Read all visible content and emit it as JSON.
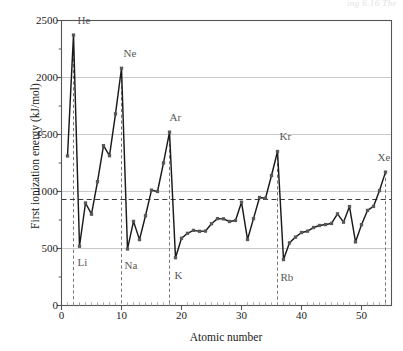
{
  "figure": {
    "caption_remnant": "ing 6.16  The",
    "colors": {
      "line": "#1a1a1a",
      "marker": "#585858",
      "gridline": "#c9c9c9",
      "axis": "#555555",
      "dashed_guide": "#3a3a3a",
      "dashed_drop": "#6e6e6e",
      "label_text": "#1a1a1a",
      "element_label": "#585858",
      "background": "#ffffff"
    }
  },
  "chart_data": {
    "type": "line",
    "title": "",
    "xlabel": "Atomic number",
    "ylabel": "First ionization energy (kJ/mol)",
    "xlim": [
      0,
      55
    ],
    "ylim": [
      0,
      2500
    ],
    "xticks": [
      0,
      10,
      20,
      30,
      40,
      50
    ],
    "yticks": [
      0,
      500,
      1000,
      1500,
      2000,
      2500
    ],
    "xminor_step": 1,
    "grid": "horizontal-major",
    "legend": "none",
    "guide_line": {
      "label": "",
      "value": 930,
      "style": "dashed",
      "orientation": "horizontal"
    },
    "noble_gas_drop_lines": [
      {
        "symbol": "He",
        "x": 2,
        "y": 2372
      },
      {
        "symbol": "Ne",
        "x": 10,
        "y": 2081
      },
      {
        "symbol": "Ar",
        "x": 18,
        "y": 1521
      },
      {
        "symbol": "Kr",
        "x": 36,
        "y": 1351
      },
      {
        "symbol": "Xe",
        "x": 54,
        "y": 1170
      }
    ],
    "annotations": [
      {
        "text": "He",
        "x": 2,
        "y": 2372,
        "dx": 4,
        "dy": -15
      },
      {
        "text": "Ne",
        "x": 10,
        "y": 2081,
        "dx": 2,
        "dy": -15
      },
      {
        "text": "Ar",
        "x": 18,
        "y": 1521,
        "dx": 0,
        "dy": -15
      },
      {
        "text": "Kr",
        "x": 36,
        "y": 1351,
        "dx": 2,
        "dy": -15
      },
      {
        "text": "Xe",
        "x": 54,
        "y": 1170,
        "dx": -8,
        "dy": -15
      },
      {
        "text": "Li",
        "x": 3,
        "y": 520,
        "dx": -2,
        "dy": 16
      },
      {
        "text": "Na",
        "x": 11,
        "y": 496,
        "dx": -3,
        "dy": 16
      },
      {
        "text": "K",
        "x": 19,
        "y": 419,
        "dx": -1,
        "dy": 17
      },
      {
        "text": "Rb",
        "x": 37,
        "y": 403,
        "dx": -3,
        "dy": 17
      }
    ],
    "x": [
      1,
      2,
      3,
      4,
      5,
      6,
      7,
      8,
      9,
      10,
      11,
      12,
      13,
      14,
      15,
      16,
      17,
      18,
      19,
      20,
      21,
      22,
      23,
      24,
      25,
      26,
      27,
      28,
      29,
      30,
      31,
      32,
      33,
      34,
      35,
      36,
      37,
      38,
      39,
      40,
      41,
      42,
      43,
      44,
      45,
      46,
      47,
      48,
      49,
      50,
      51,
      52,
      53,
      54
    ],
    "series": [
      {
        "name": "First ionization energy",
        "element_symbols": [
          "H",
          "He",
          "Li",
          "Be",
          "B",
          "C",
          "N",
          "O",
          "F",
          "Ne",
          "Na",
          "Mg",
          "Al",
          "Si",
          "P",
          "S",
          "Cl",
          "Ar",
          "K",
          "Ca",
          "Sc",
          "Ti",
          "V",
          "Cr",
          "Mn",
          "Fe",
          "Co",
          "Ni",
          "Cu",
          "Zn",
          "Ga",
          "Ge",
          "As",
          "Se",
          "Br",
          "Kr",
          "Rb",
          "Sr",
          "Y",
          "Zr",
          "Nb",
          "Mo",
          "Tc",
          "Ru",
          "Rh",
          "Pd",
          "Ag",
          "Cd",
          "In",
          "Sn",
          "Sb",
          "Te",
          "I",
          "Xe"
        ],
        "values": [
          1312,
          2372,
          520,
          899,
          801,
          1086,
          1402,
          1314,
          1681,
          2081,
          496,
          738,
          578,
          787,
          1012,
          1000,
          1251,
          1521,
          419,
          590,
          633,
          659,
          651,
          653,
          717,
          762,
          760,
          737,
          746,
          906,
          579,
          762,
          947,
          941,
          1140,
          1351,
          403,
          550,
          600,
          640,
          652,
          684,
          702,
          710,
          720,
          804,
          731,
          868,
          558,
          709,
          834,
          869,
          1008,
          1170
        ]
      }
    ]
  }
}
